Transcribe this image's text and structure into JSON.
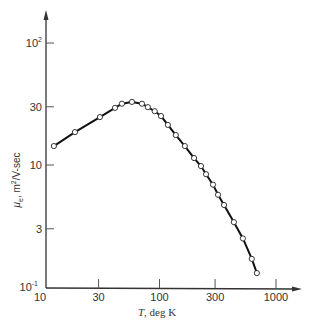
{
  "chart_data": {
    "type": "line",
    "title": "",
    "xlabel": "T, deg K",
    "ylabel": "μe, m²/V-sec",
    "xscale": "log",
    "yscale": "log",
    "xlim": [
      10,
      1400
    ],
    "ylim": [
      1,
      150
    ],
    "grid": false,
    "legend": null,
    "x_ticks": [
      {
        "value": 10,
        "label": "10"
      },
      {
        "value": 30,
        "label": "30"
      },
      {
        "value": 100,
        "label": "100"
      },
      {
        "value": 300,
        "label": "300"
      },
      {
        "value": 1000,
        "label": "1000"
      }
    ],
    "y_ticks": [
      {
        "value": 1,
        "label": "10",
        "sup": "-1"
      },
      {
        "value": 3,
        "label": "3",
        "sup": ""
      },
      {
        "value": 10,
        "label": "10",
        "sup": ""
      },
      {
        "value": 30,
        "label": "30",
        "sup": ""
      },
      {
        "value": 100,
        "label": "10",
        "sup": "2"
      }
    ],
    "series": [
      {
        "name": "electron mobility",
        "marker": "open-circle",
        "color": "#111111",
        "x": [
          12.4,
          18.8,
          30.8,
          41.5,
          47.6,
          58,
          70.7,
          79.5,
          91,
          103,
          118,
          138,
          165,
          198,
          227,
          251,
          288,
          318,
          358,
          435,
          520,
          620,
          685
        ],
        "y": [
          14.3,
          18.6,
          24.7,
          29.4,
          31.8,
          32.9,
          31.8,
          29.8,
          27.6,
          25.2,
          21.3,
          17.6,
          14.3,
          11.4,
          9.8,
          8.4,
          6.9,
          5.7,
          4.7,
          3.4,
          2.5,
          1.7,
          1.3
        ]
      }
    ]
  },
  "labels": {
    "xlabel_italic": "T",
    "xlabel_rest": ", deg K",
    "ylabel_mu": "μ",
    "ylabel_sub": "e",
    "ylabel_rest": ", m",
    "ylabel_sup": "2",
    "ylabel_tail": "/V-sec"
  }
}
